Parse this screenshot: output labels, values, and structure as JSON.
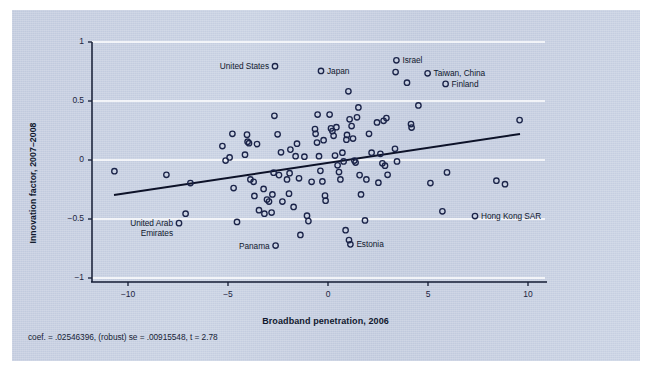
{
  "figure": {
    "background_color": "#c3ccdf",
    "axis_color": "#131b33",
    "gridline_color": "#ffffff",
    "marker_color": "#1b2449",
    "fit_line_color": "#0d1228",
    "note": "coef. = .02546396, (robust) se = .00915548, t = 2.78"
  },
  "chart_data": {
    "type": "scatter",
    "title": "",
    "xlabel": "Broadband penetration, 2006",
    "ylabel": "Innovation factor, 2007–2008",
    "xlim": [
      -11.5,
      11.0
    ],
    "ylim": [
      -1.05,
      1.05
    ],
    "xticks": [
      -10,
      -5,
      0,
      5,
      10
    ],
    "xticklabels": [
      "−10",
      "−5",
      "0",
      "5",
      "10"
    ],
    "yticks": [
      -1,
      -0.5,
      0,
      0.5,
      1
    ],
    "yticklabels": [
      "−1",
      "−0.5",
      "0",
      "0.5",
      "1"
    ],
    "grid": "horizontal-white-gridlines",
    "legend": "none",
    "fit_line": {
      "type": "linear",
      "slope": 0.02546396,
      "intercept": -0.0246,
      "x_start": -10.7,
      "x_end": 9.6,
      "y_start": -0.297,
      "y_end": 0.22
    },
    "annotations": [
      {
        "label": "United States",
        "x": -2.65,
        "y": 0.795,
        "side": "left"
      },
      {
        "label": "Japan",
        "x": -0.35,
        "y": 0.755,
        "side": "right"
      },
      {
        "label": "Israel",
        "x": 3.42,
        "y": 0.845,
        "side": "right"
      },
      {
        "label": "Taiwan, China",
        "x": 4.98,
        "y": 0.735,
        "side": "right"
      },
      {
        "label": "Finland",
        "x": 5.88,
        "y": 0.645,
        "side": "right"
      },
      {
        "label": "United Arab\nEmirates",
        "x": -7.45,
        "y": -0.535,
        "side": "left"
      },
      {
        "label": "Panama",
        "x": -2.62,
        "y": -0.725,
        "side": "left"
      },
      {
        "label": "Estonia",
        "x": 1.12,
        "y": -0.715,
        "side": "right"
      },
      {
        "label": "Hong Kong SAR",
        "x": 7.35,
        "y": -0.475,
        "side": "right"
      }
    ],
    "points": [
      {
        "x": -10.68,
        "y": -0.095
      },
      {
        "x": -8.08,
        "y": -0.125
      },
      {
        "x": -7.45,
        "y": -0.535
      },
      {
        "x": -7.12,
        "y": -0.455
      },
      {
        "x": -6.88,
        "y": -0.195
      },
      {
        "x": -5.28,
        "y": 0.118
      },
      {
        "x": -5.12,
        "y": -0.005
      },
      {
        "x": -4.92,
        "y": 0.022
      },
      {
        "x": -4.78,
        "y": 0.222
      },
      {
        "x": -4.72,
        "y": -0.238
      },
      {
        "x": -4.55,
        "y": -0.525
      },
      {
        "x": -4.15,
        "y": 0.045
      },
      {
        "x": -4.05,
        "y": 0.215
      },
      {
        "x": -3.95,
        "y": 0.142
      },
      {
        "x": -4.02,
        "y": 0.155
      },
      {
        "x": -3.88,
        "y": -0.165
      },
      {
        "x": -3.72,
        "y": -0.185
      },
      {
        "x": -3.68,
        "y": -0.305
      },
      {
        "x": -3.55,
        "y": 0.135
      },
      {
        "x": -3.45,
        "y": -0.425
      },
      {
        "x": -3.22,
        "y": -0.245
      },
      {
        "x": -3.18,
        "y": -0.455
      },
      {
        "x": -3.05,
        "y": -0.335
      },
      {
        "x": -2.95,
        "y": -0.352
      },
      {
        "x": -2.82,
        "y": -0.445
      },
      {
        "x": -2.78,
        "y": -0.292
      },
      {
        "x": -2.72,
        "y": -0.108
      },
      {
        "x": -2.68,
        "y": 0.375
      },
      {
        "x": -2.65,
        "y": 0.795
      },
      {
        "x": -2.62,
        "y": -0.725
      },
      {
        "x": -2.52,
        "y": 0.218
      },
      {
        "x": -2.45,
        "y": -0.128
      },
      {
        "x": -2.35,
        "y": 0.065
      },
      {
        "x": -2.28,
        "y": -0.352
      },
      {
        "x": -2.05,
        "y": -0.165
      },
      {
        "x": -1.95,
        "y": -0.285
      },
      {
        "x": -1.92,
        "y": -0.112
      },
      {
        "x": -1.88,
        "y": 0.088
      },
      {
        "x": -1.72,
        "y": -0.398
      },
      {
        "x": -1.62,
        "y": 0.032
      },
      {
        "x": -1.55,
        "y": 0.138
      },
      {
        "x": -1.45,
        "y": -0.155
      },
      {
        "x": -1.38,
        "y": -0.635
      },
      {
        "x": -1.18,
        "y": 0.028
      },
      {
        "x": -1.05,
        "y": -0.472
      },
      {
        "x": -0.98,
        "y": -0.518
      },
      {
        "x": -0.82,
        "y": -0.185
      },
      {
        "x": -0.65,
        "y": 0.262
      },
      {
        "x": -0.62,
        "y": 0.222
      },
      {
        "x": -0.55,
        "y": 0.148
      },
      {
        "x": -0.52,
        "y": 0.385
      },
      {
        "x": -0.45,
        "y": 0.032
      },
      {
        "x": -0.38,
        "y": -0.092
      },
      {
        "x": -0.35,
        "y": 0.755
      },
      {
        "x": -0.28,
        "y": -0.182
      },
      {
        "x": -0.22,
        "y": 0.168
      },
      {
        "x": -0.15,
        "y": -0.302
      },
      {
        "x": -0.12,
        "y": -0.345
      },
      {
        "x": 0.08,
        "y": 0.385
      },
      {
        "x": 0.15,
        "y": 0.268
      },
      {
        "x": 0.22,
        "y": 0.245
      },
      {
        "x": 0.28,
        "y": 0.205
      },
      {
        "x": 0.35,
        "y": 0.038
      },
      {
        "x": 0.42,
        "y": 0.278
      },
      {
        "x": 0.48,
        "y": -0.045
      },
      {
        "x": 0.55,
        "y": -0.102
      },
      {
        "x": 0.62,
        "y": -0.165
      },
      {
        "x": 0.72,
        "y": 0.062
      },
      {
        "x": 0.78,
        "y": -0.012
      },
      {
        "x": 0.88,
        "y": -0.595
      },
      {
        "x": 0.92,
        "y": 0.172
      },
      {
        "x": 0.95,
        "y": 0.212
      },
      {
        "x": 1.02,
        "y": 0.582
      },
      {
        "x": 1.08,
        "y": 0.345
      },
      {
        "x": 1.05,
        "y": -0.678
      },
      {
        "x": 1.12,
        "y": -0.715
      },
      {
        "x": 1.18,
        "y": 0.288
      },
      {
        "x": 1.25,
        "y": 0.182
      },
      {
        "x": 1.32,
        "y": -0.005
      },
      {
        "x": 1.38,
        "y": -0.022
      },
      {
        "x": 1.45,
        "y": 0.362
      },
      {
        "x": 1.52,
        "y": 0.445
      },
      {
        "x": 1.58,
        "y": -0.128
      },
      {
        "x": 1.65,
        "y": -0.292
      },
      {
        "x": 1.85,
        "y": -0.512
      },
      {
        "x": 1.92,
        "y": -0.165
      },
      {
        "x": 2.05,
        "y": 0.222
      },
      {
        "x": 2.18,
        "y": 0.062
      },
      {
        "x": 2.45,
        "y": 0.318
      },
      {
        "x": 2.52,
        "y": -0.192
      },
      {
        "x": 2.62,
        "y": 0.052
      },
      {
        "x": 2.72,
        "y": -0.028
      },
      {
        "x": 2.78,
        "y": 0.332
      },
      {
        "x": 2.85,
        "y": -0.048
      },
      {
        "x": 2.92,
        "y": 0.355
      },
      {
        "x": 2.98,
        "y": -0.125
      },
      {
        "x": 3.35,
        "y": 0.095
      },
      {
        "x": 3.42,
        "y": 0.845
      },
      {
        "x": 3.38,
        "y": 0.745
      },
      {
        "x": 3.45,
        "y": -0.012
      },
      {
        "x": 3.95,
        "y": 0.655
      },
      {
        "x": 4.15,
        "y": 0.305
      },
      {
        "x": 4.18,
        "y": 0.275
      },
      {
        "x": 4.52,
        "y": 0.462
      },
      {
        "x": 4.98,
        "y": 0.735
      },
      {
        "x": 5.12,
        "y": -0.195
      },
      {
        "x": 5.72,
        "y": -0.435
      },
      {
        "x": 5.88,
        "y": 0.645
      },
      {
        "x": 5.95,
        "y": -0.105
      },
      {
        "x": 7.35,
        "y": -0.475
      },
      {
        "x": 8.42,
        "y": -0.175
      },
      {
        "x": 8.85,
        "y": -0.205
      },
      {
        "x": 9.58,
        "y": 0.338
      }
    ]
  }
}
